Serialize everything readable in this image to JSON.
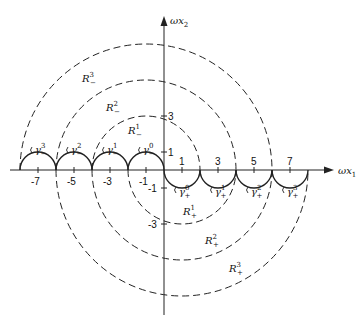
{
  "figure": {
    "x_axis_label": "ωx",
    "x_axis_sub": "1",
    "y_axis_label": "ωx",
    "y_axis_sub": "2",
    "x_ticks": [
      "-7",
      "-5",
      "-3",
      "-1",
      "1",
      "3",
      "5",
      "7"
    ],
    "y_ticks": [
      "3",
      "1",
      "-1",
      "-3"
    ],
    "regions_upper": [
      {
        "label": "R",
        "sup": "1",
        "sub": "−"
      },
      {
        "label": "R",
        "sup": "2",
        "sub": "−"
      },
      {
        "label": "R",
        "sup": "3",
        "sub": "−"
      }
    ],
    "regions_lower": [
      {
        "label": "R",
        "sup": "1",
        "sub": "+"
      },
      {
        "label": "R",
        "sup": "2",
        "sub": "+"
      },
      {
        "label": "R",
        "sup": "3",
        "sub": "+"
      }
    ],
    "contours_upper": [
      {
        "label": "γ",
        "sup": "0",
        "sub": "−"
      },
      {
        "label": "γ",
        "sup": "1",
        "sub": "−"
      },
      {
        "label": "γ",
        "sup": "2",
        "sub": "−"
      },
      {
        "label": "γ",
        "sup": "3",
        "sub": "−"
      }
    ],
    "contours_lower": [
      {
        "label": "γ",
        "sup": "0",
        "sub": "+"
      },
      {
        "label": "γ",
        "sup": "1",
        "sub": "+"
      },
      {
        "label": "γ",
        "sup": "2",
        "sub": "+"
      },
      {
        "label": "γ",
        "sup": "3",
        "sub": "+"
      }
    ]
  }
}
